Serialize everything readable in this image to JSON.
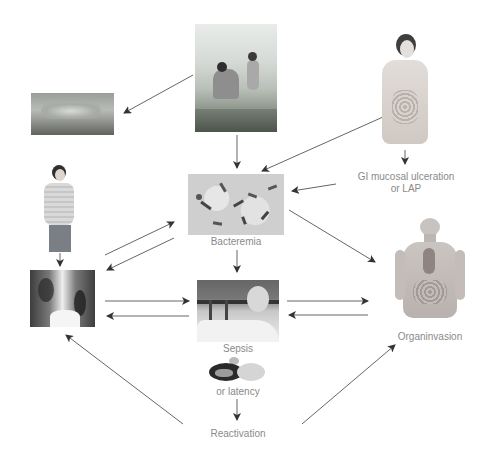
{
  "diagram": {
    "nodes": [
      {
        "id": "environment",
        "icon": "outdoor-farming-scene-image",
        "label": ""
      },
      {
        "id": "skin_lesion",
        "icon": "skin-lesion-image",
        "label": ""
      },
      {
        "id": "oral_ingestion",
        "icon": "woman-eating-digestive-tract-image",
        "label": ""
      },
      {
        "id": "gi_entry",
        "icon": "",
        "label_line1": "GI mucosal ulceration",
        "label_line2": "or LAP"
      },
      {
        "id": "inhalation",
        "icon": "man-breathing-image",
        "label": ""
      },
      {
        "id": "bacteremia",
        "icon": "bacteria-micrograph-image",
        "label": "Bacteremia"
      },
      {
        "id": "lung",
        "icon": "chest-xray-image",
        "label": ""
      },
      {
        "id": "sepsis",
        "icon": "patient-in-bed-image",
        "label": "Sepsis"
      },
      {
        "id": "latency",
        "icon": "sleeping-person-image",
        "label": "or latency"
      },
      {
        "id": "reactivation",
        "icon": "",
        "label": "Reactivation"
      },
      {
        "id": "organ_invasion",
        "icon": "human-anatomy-image",
        "label": "Organinvasion"
      }
    ],
    "edges": [
      {
        "from": "environment",
        "to": "skin_lesion"
      },
      {
        "from": "environment",
        "to": "bacteremia"
      },
      {
        "from": "oral_ingestion",
        "to": "bacteremia"
      },
      {
        "from": "oral_ingestion",
        "to": "gi_entry"
      },
      {
        "from": "gi_entry",
        "to": "bacteremia"
      },
      {
        "from": "inhalation",
        "to": "lung"
      },
      {
        "from": "lung",
        "to": "bacteremia"
      },
      {
        "from": "bacteremia",
        "to": "lung"
      },
      {
        "from": "bacteremia",
        "to": "sepsis"
      },
      {
        "from": "bacteremia",
        "to": "organ_invasion"
      },
      {
        "from": "lung",
        "to": "sepsis"
      },
      {
        "from": "sepsis",
        "to": "lung"
      },
      {
        "from": "sepsis",
        "to": "organ_invasion"
      },
      {
        "from": "organ_invasion",
        "to": "sepsis"
      },
      {
        "from": "latency",
        "to": "reactivation"
      },
      {
        "from": "reactivation",
        "to": "lung"
      },
      {
        "from": "reactivation",
        "to": "organ_invasion"
      }
    ],
    "colors": {
      "arrow": "#555555",
      "label": "#8a8a8a",
      "background": "#ffffff"
    }
  }
}
